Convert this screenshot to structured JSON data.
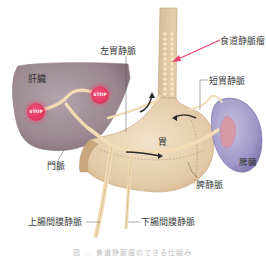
{
  "diagram": {
    "type": "anatomical-illustration",
    "colors": {
      "liver": "#9b8890",
      "vein": "#f3dcb6",
      "stomach": "#e9d3b4",
      "spleen": "#9e96c4",
      "stop_sign": "#e03a62",
      "varices_arrow": "#e8456e",
      "flow_arrow": "#2a2a2a",
      "leader_line": "#555555"
    },
    "labels": {
      "liver": "肝臓",
      "stomach": "胃",
      "spleen": "脾臓",
      "esophageal_varices": "食道静脈瘤",
      "left_gastric_vein": "左胃静脈",
      "short_gastric_vein": "短胃静脈",
      "portal_vein": "門脈",
      "splenic_vein": "脾静脈",
      "superior_mesenteric_vein": "上腸間膜静脈",
      "inferior_mesenteric_vein": "下腸間膜静脈"
    },
    "stop_signs": [
      {
        "text": "STOP"
      },
      {
        "text": "STOP"
      }
    ],
    "caption": "図 … 食道静脈瘤のできる仕組み"
  }
}
